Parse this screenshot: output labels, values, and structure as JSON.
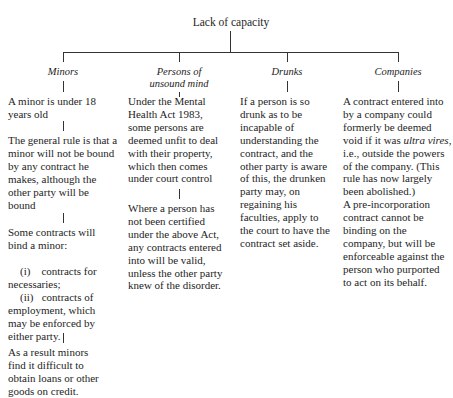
{
  "diagram": {
    "root": "Lack of capacity",
    "branches": [
      {
        "title": "Minors",
        "paragraphs": [
          "A minor is under 18\nyears old",
          "The general rule is that a\nminor will not be bound\nby any contract he\nmakes, although the\nother party will be\nbound",
          "Some contracts will\nbind a minor:",
          "As a result minors\nfind it difficult to\nobtain loans or other\ngoods on credit."
        ],
        "list_items": [
          {
            "marker": "(i)",
            "text": "contracts for\nnecessaries;"
          },
          {
            "marker": "(ii)",
            "text": "contracts of\nemployment, which\nmay be enforced by\neither party."
          }
        ]
      },
      {
        "title_line1": "Persons of",
        "title_line2": "unsound mind",
        "paragraphs": [
          "Under the Mental\nHealth Act 1983,\nsome persons are\ndeemed unfit to deal\nwith their property,\nwhich then comes\nunder court control",
          "Where a person has\nnot been certified\nunder the above Act,\nany contracts entered\ninto will be valid,\nunless the other party\nknew of the disorder."
        ]
      },
      {
        "title": "Drunks",
        "paragraphs": [
          "If a person is so\ndrunk as to be\nincapable of\nunderstanding the\ncontract, and the\nother party is aware\nof this, the drunken\nparty may, on\nregaining his\nfaculties, apply to\nthe court to have the\ncontract set aside."
        ]
      },
      {
        "title": "Companies",
        "p1_before": "A contract entered into\nby a company could\nformerly be deemed\nvoid if it was ",
        "p1_italic": "ultra vires",
        "p1_after": ",\ni.e., outside the powers\nof the company. (This\nrule has now largely\nbeen abolished.)\nA pre-incorporation\ncontract cannot be\nbinding on the\ncompany, but will be\nenforceable against the\nperson who purported\nto act on its behalf."
      }
    ]
  }
}
